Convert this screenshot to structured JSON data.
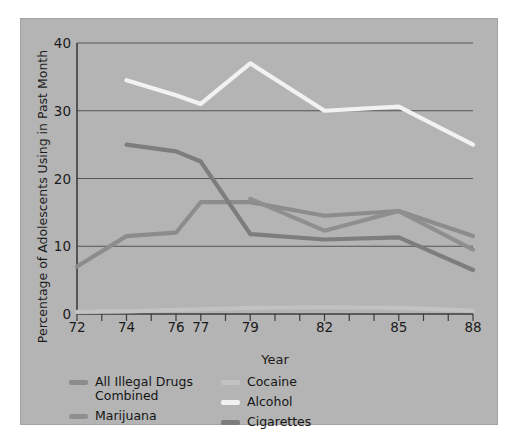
{
  "chart_data": {
    "type": "line",
    "title": "",
    "xlabel": "Year",
    "ylabel": "Percentage of Adolescents Using in Past Month",
    "xlim": [
      72,
      88
    ],
    "ylim": [
      0,
      40
    ],
    "ytick_labels": [
      "0",
      "10",
      "20",
      "30",
      "40"
    ],
    "yticks": [
      0,
      10,
      20,
      30,
      40
    ],
    "xtick_labels": [
      "72",
      "74",
      "76",
      "77",
      "79",
      "82",
      "85",
      "88"
    ],
    "xticks_labeled": [
      72,
      74,
      76,
      77,
      79,
      82,
      85,
      88
    ],
    "xticks_all": [
      72,
      73,
      74,
      75,
      76,
      77,
      78,
      79,
      80,
      81,
      82,
      83,
      84,
      85,
      86,
      87,
      88
    ],
    "grid": "horizontal",
    "legend_position": "below-axis",
    "background_color": "#b4b4b4",
    "series": [
      {
        "name": "All Illegal Drugs\nCombined",
        "legend_label": "All Illegal Drugs\nCombined",
        "color": "#8c8c8c",
        "x": [
          72,
          74,
          76,
          77,
          79,
          82,
          85,
          88
        ],
        "values": [
          7,
          11.5,
          12,
          16.5,
          16.5,
          14.5,
          15.2,
          11.5
        ]
      },
      {
        "name": "Marijuana",
        "legend_label": "Marijuana",
        "color": "#8f8f8f",
        "x": [
          79,
          82,
          85,
          88
        ],
        "values": [
          17,
          12.3,
          15.2,
          9.5
        ]
      },
      {
        "name": "Cocaine",
        "legend_label": "Cocaine",
        "color": "#c2c2c2",
        "x": [
          72,
          74,
          76,
          77,
          79,
          82,
          85,
          88
        ],
        "values": [
          0.3,
          0.4,
          0.6,
          0.7,
          0.9,
          1.0,
          0.9,
          0.5
        ]
      },
      {
        "name": "Alcohol",
        "legend_label": "Alcohol",
        "color": "#f2f2f2",
        "x": [
          74,
          76,
          77,
          79,
          82,
          85,
          88
        ],
        "values": [
          34.5,
          32.3,
          31,
          37,
          30,
          30.6,
          25
        ]
      },
      {
        "name": "Cigarettes",
        "legend_label": "Cigarettes",
        "color": "#7d7d7d",
        "x": [
          74,
          76,
          77,
          79,
          82,
          85,
          88
        ],
        "values": [
          25,
          24,
          22.5,
          11.8,
          11,
          11.3,
          6.5
        ]
      }
    ]
  },
  "legend": {
    "columns": [
      {
        "items": [
          "All Illegal Drugs\nCombined",
          "Marijuana"
        ]
      },
      {
        "items": [
          "Cocaine",
          "Alcohol",
          "Cigarettes"
        ]
      }
    ]
  }
}
